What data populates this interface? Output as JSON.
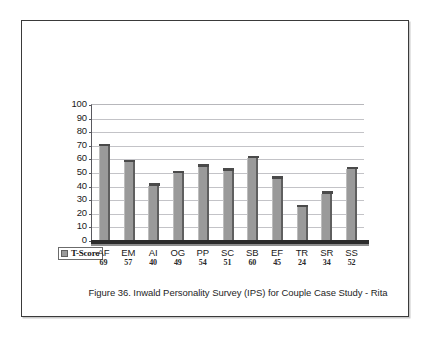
{
  "figure": {
    "caption": "Figure 36. Inwald Personality Survey (IPS) for Couple Case Study - Rita"
  },
  "legend": {
    "series_label": "T-Score",
    "swatch_color": "#9a9a9a"
  },
  "axis": {
    "y_ticks": [
      "100",
      "90",
      "80",
      "70",
      "60",
      "50",
      "40",
      "30",
      "20",
      "10",
      "0"
    ]
  },
  "chart_data": {
    "type": "bar",
    "title": "Figure 36. Inwald Personality Survey (IPS) for Couple Case Study - Rita",
    "xlabel": "",
    "ylabel": "",
    "ylim": [
      0,
      100
    ],
    "ytick_step": 10,
    "grid": true,
    "legend_position": "bottom-left",
    "bar_color": "#9a9a9a",
    "categories": [
      "AF",
      "EM",
      "AI",
      "OG",
      "PP",
      "SC",
      "SB",
      "EF",
      "TR",
      "SR",
      "SS"
    ],
    "series": [
      {
        "name": "T-Score",
        "values": [
          69,
          57,
          40,
          49,
          54,
          51,
          60,
          45,
          24,
          34,
          52
        ]
      }
    ],
    "value_labels": [
      "69",
      "57",
      "40",
      "49",
      "54",
      "51",
      "60",
      "45",
      "24",
      "34",
      "52"
    ]
  }
}
